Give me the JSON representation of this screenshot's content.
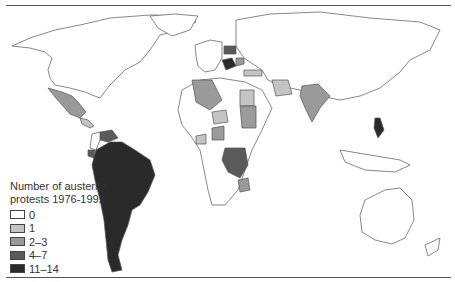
{
  "figure": {
    "type": "choropleth world map",
    "legend": {
      "title_line1": "Number of austerity",
      "title_line2": "protests 1976-1992",
      "items": [
        {
          "label": "0",
          "color": "#ffffff"
        },
        {
          "label": "1",
          "color": "#c4c4c4"
        },
        {
          "label": "2–3",
          "color": "#9a9a9a"
        },
        {
          "label": "4–7",
          "color": "#5a5a5a"
        },
        {
          "label": "11–14",
          "color": "#2a2a2a"
        }
      ]
    },
    "colors": {
      "outline": "#555555",
      "background": "#ffffff"
    }
  }
}
